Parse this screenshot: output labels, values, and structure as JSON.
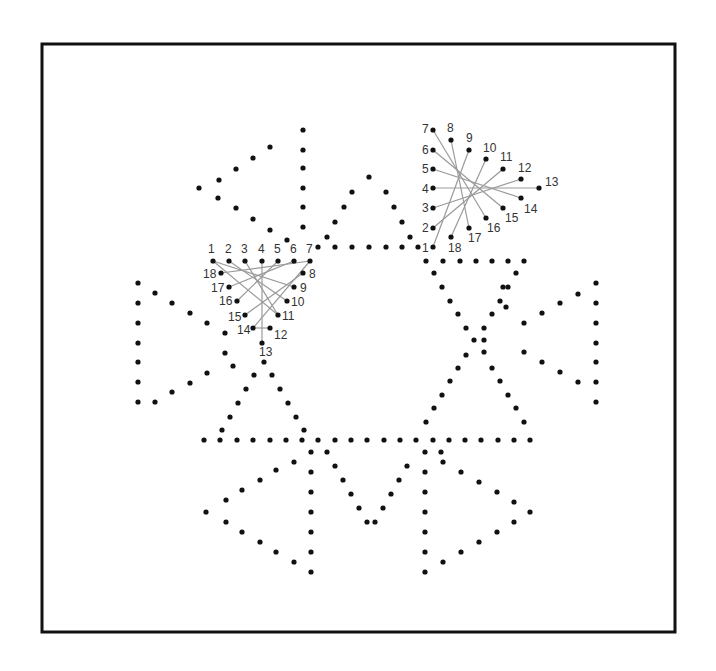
{
  "frame": {
    "x": 42,
    "y": 44,
    "w": 633,
    "h": 588,
    "stroke": "#111111"
  },
  "colors": {
    "dot": "#111111",
    "thread": "#9a9a9a",
    "label": "#333333"
  },
  "dot_radius": 2.6,
  "dots": [
    [
      303,
      130
    ],
    [
      270,
      147
    ],
    [
      253,
      158
    ],
    [
      236,
      169
    ],
    [
      219,
      180
    ],
    [
      199,
      188
    ],
    [
      218,
      198
    ],
    [
      236,
      208
    ],
    [
      253,
      219
    ],
    [
      270,
      230
    ],
    [
      287,
      240
    ],
    [
      303,
      150
    ],
    [
      303,
      168
    ],
    [
      303,
      188
    ],
    [
      303,
      207
    ],
    [
      303,
      227
    ],
    [
      369,
      177
    ],
    [
      352,
      192
    ],
    [
      386,
      192
    ],
    [
      344,
      207
    ],
    [
      394,
      207
    ],
    [
      335,
      222
    ],
    [
      402,
      222
    ],
    [
      327,
      237
    ],
    [
      410,
      237
    ],
    [
      318,
      247
    ],
    [
      335,
      247
    ],
    [
      352,
      247
    ],
    [
      369,
      247
    ],
    [
      386,
      247
    ],
    [
      402,
      247
    ],
    [
      418,
      247
    ],
    [
      426,
      261
    ],
    [
      443,
      261
    ],
    [
      460,
      261
    ],
    [
      476,
      261
    ],
    [
      492,
      261
    ],
    [
      508,
      261
    ],
    [
      524,
      261
    ],
    [
      434,
      273
    ],
    [
      516,
      273
    ],
    [
      442,
      287
    ],
    [
      508,
      287
    ],
    [
      450,
      301
    ],
    [
      500,
      301
    ],
    [
      458,
      314
    ],
    [
      492,
      314
    ],
    [
      466,
      328
    ],
    [
      484,
      328
    ],
    [
      474,
      340
    ],
    [
      484,
      340
    ],
    [
      466,
      355
    ],
    [
      484,
      352
    ],
    [
      458,
      368
    ],
    [
      492,
      368
    ],
    [
      450,
      381
    ],
    [
      500,
      381
    ],
    [
      442,
      395
    ],
    [
      508,
      395
    ],
    [
      434,
      408
    ],
    [
      516,
      408
    ],
    [
      426,
      422
    ],
    [
      524,
      422
    ],
    [
      596,
      283
    ],
    [
      578,
      294
    ],
    [
      560,
      303
    ],
    [
      542,
      313
    ],
    [
      524,
      323
    ],
    [
      596,
      303
    ],
    [
      596,
      323
    ],
    [
      596,
      343
    ],
    [
      596,
      362
    ],
    [
      596,
      382
    ],
    [
      596,
      402
    ],
    [
      524,
      352
    ],
    [
      542,
      362
    ],
    [
      560,
      372
    ],
    [
      578,
      382
    ],
    [
      503,
      287
    ],
    [
      506,
      307
    ],
    [
      138,
      283
    ],
    [
      155,
      293
    ],
    [
      172,
      303
    ],
    [
      190,
      313
    ],
    [
      207,
      323
    ],
    [
      138,
      303
    ],
    [
      138,
      323
    ],
    [
      138,
      343
    ],
    [
      138,
      362
    ],
    [
      138,
      382
    ],
    [
      138,
      402
    ],
    [
      190,
      383
    ],
    [
      172,
      392
    ],
    [
      155,
      402
    ],
    [
      207,
      373
    ],
    [
      225,
      333
    ],
    [
      225,
      353
    ],
    [
      233,
      366
    ],
    [
      264,
      362
    ],
    [
      254,
      375
    ],
    [
      272,
      375
    ],
    [
      246,
      389
    ],
    [
      280,
      389
    ],
    [
      238,
      403
    ],
    [
      288,
      403
    ],
    [
      230,
      417
    ],
    [
      296,
      417
    ],
    [
      222,
      430
    ],
    [
      304,
      430
    ],
    [
      204,
      440
    ],
    [
      220,
      440
    ],
    [
      237,
      440
    ],
    [
      253,
      440
    ],
    [
      270,
      440
    ],
    [
      286,
      440
    ],
    [
      302,
      440
    ],
    [
      318,
      440
    ],
    [
      335,
      440
    ],
    [
      351,
      440
    ],
    [
      367,
      440
    ],
    [
      384,
      440
    ],
    [
      400,
      440
    ],
    [
      416,
      440
    ],
    [
      433,
      440
    ],
    [
      449,
      440
    ],
    [
      465,
      440
    ],
    [
      481,
      440
    ],
    [
      498,
      440
    ],
    [
      514,
      440
    ],
    [
      530,
      440
    ],
    [
      311,
      452
    ],
    [
      327,
      452
    ],
    [
      425,
      452
    ],
    [
      441,
      452
    ],
    [
      335,
      466
    ],
    [
      343,
      480
    ],
    [
      351,
      494
    ],
    [
      359,
      508
    ],
    [
      367,
      522
    ],
    [
      375,
      522
    ],
    [
      383,
      508
    ],
    [
      391,
      494
    ],
    [
      399,
      480
    ],
    [
      407,
      466
    ],
    [
      311,
      472
    ],
    [
      311,
      492
    ],
    [
      311,
      512
    ],
    [
      311,
      532
    ],
    [
      311,
      552
    ],
    [
      311,
      572
    ],
    [
      294,
      462
    ],
    [
      276,
      470
    ],
    [
      260,
      480
    ],
    [
      242,
      490
    ],
    [
      226,
      500
    ],
    [
      206,
      512
    ],
    [
      226,
      522
    ],
    [
      242,
      532
    ],
    [
      260,
      542
    ],
    [
      276,
      552
    ],
    [
      294,
      562
    ],
    [
      425,
      472
    ],
    [
      425,
      492
    ],
    [
      425,
      512
    ],
    [
      425,
      532
    ],
    [
      425,
      552
    ],
    [
      425,
      572
    ],
    [
      443,
      462
    ],
    [
      461,
      472
    ],
    [
      479,
      482
    ],
    [
      497,
      492
    ],
    [
      514,
      502
    ],
    [
      530,
      512
    ],
    [
      514,
      522
    ],
    [
      497,
      532
    ],
    [
      479,
      542
    ],
    [
      461,
      552
    ],
    [
      443,
      562
    ]
  ],
  "star_left": {
    "center": [
      262,
      292
    ],
    "points": [
      {
        "n": "1",
        "x": 213,
        "y": 261,
        "lx": 208,
        "ly": 253
      },
      {
        "n": "2",
        "x": 229,
        "y": 261,
        "lx": 225,
        "ly": 253
      },
      {
        "n": "3",
        "x": 245,
        "y": 261,
        "lx": 241,
        "ly": 253
      },
      {
        "n": "4",
        "x": 262,
        "y": 261,
        "lx": 258,
        "ly": 253
      },
      {
        "n": "5",
        "x": 278,
        "y": 261,
        "lx": 274,
        "ly": 253
      },
      {
        "n": "6",
        "x": 294,
        "y": 261,
        "lx": 290,
        "ly": 253
      },
      {
        "n": "7",
        "x": 310,
        "y": 261,
        "lx": 306,
        "ly": 253
      },
      {
        "n": "8",
        "x": 303,
        "y": 273,
        "lx": 309,
        "ly": 278
      },
      {
        "n": "9",
        "x": 294,
        "y": 287,
        "lx": 300,
        "ly": 292
      },
      {
        "n": "10",
        "x": 287,
        "y": 301,
        "lx": 291,
        "ly": 306
      },
      {
        "n": "11",
        "x": 278,
        "y": 315,
        "lx": 282,
        "ly": 320
      },
      {
        "n": "12",
        "x": 270,
        "y": 328,
        "lx": 274,
        "ly": 339
      },
      {
        "n": "13",
        "x": 262,
        "y": 343,
        "lx": 259,
        "ly": 356
      },
      {
        "n": "14",
        "x": 253,
        "y": 328,
        "lx": 237,
        "ly": 334
      },
      {
        "n": "15",
        "x": 245,
        "y": 315,
        "lx": 228,
        "ly": 321
      },
      {
        "n": "16",
        "x": 237,
        "y": 301,
        "lx": 219,
        "ly": 305
      },
      {
        "n": "17",
        "x": 229,
        "y": 287,
        "lx": 211,
        "ly": 292
      },
      {
        "n": "18",
        "x": 221,
        "y": 273,
        "lx": 203,
        "ly": 278
      }
    ],
    "threads": [
      [
        1,
        9
      ],
      [
        2,
        10
      ],
      [
        3,
        11
      ],
      [
        4,
        13
      ],
      [
        5,
        16
      ],
      [
        6,
        17
      ],
      [
        7,
        18
      ],
      [
        8,
        15
      ],
      [
        12,
        14
      ],
      [
        1,
        11
      ],
      [
        7,
        14
      ]
    ]
  },
  "star_right": {
    "center": [
      468,
      190
    ],
    "points": [
      {
        "n": "1",
        "x": 433,
        "y": 247,
        "lx": 422,
        "ly": 252
      },
      {
        "n": "2",
        "x": 433,
        "y": 228,
        "lx": 422,
        "ly": 232
      },
      {
        "n": "3",
        "x": 433,
        "y": 208,
        "lx": 422,
        "ly": 212
      },
      {
        "n": "4",
        "x": 433,
        "y": 188,
        "lx": 422,
        "ly": 193
      },
      {
        "n": "5",
        "x": 433,
        "y": 169,
        "lx": 422,
        "ly": 173
      },
      {
        "n": "6",
        "x": 433,
        "y": 150,
        "lx": 422,
        "ly": 154
      },
      {
        "n": "7",
        "x": 433,
        "y": 130,
        "lx": 422,
        "ly": 133
      },
      {
        "n": "8",
        "x": 451,
        "y": 140,
        "lx": 447,
        "ly": 132
      },
      {
        "n": "9",
        "x": 469,
        "y": 150,
        "lx": 466,
        "ly": 142
      },
      {
        "n": "10",
        "x": 486,
        "y": 159,
        "lx": 483,
        "ly": 152
      },
      {
        "n": "11",
        "x": 503,
        "y": 169,
        "lx": 500,
        "ly": 161
      },
      {
        "n": "12",
        "x": 521,
        "y": 179,
        "lx": 518,
        "ly": 172
      },
      {
        "n": "13",
        "x": 539,
        "y": 188,
        "lx": 545,
        "ly": 186
      },
      {
        "n": "14",
        "x": 521,
        "y": 198,
        "lx": 524,
        "ly": 213
      },
      {
        "n": "15",
        "x": 503,
        "y": 208,
        "lx": 505,
        "ly": 222
      },
      {
        "n": "16",
        "x": 486,
        "y": 218,
        "lx": 487,
        "ly": 232
      },
      {
        "n": "17",
        "x": 469,
        "y": 228,
        "lx": 468,
        "ly": 242
      },
      {
        "n": "18",
        "x": 451,
        "y": 237,
        "lx": 448,
        "ly": 252
      }
    ],
    "threads": [
      [
        1,
        9
      ],
      [
        2,
        11
      ],
      [
        3,
        12
      ],
      [
        4,
        13
      ],
      [
        5,
        14
      ],
      [
        6,
        15
      ],
      [
        7,
        16
      ],
      [
        8,
        17
      ],
      [
        10,
        18
      ]
    ]
  }
}
